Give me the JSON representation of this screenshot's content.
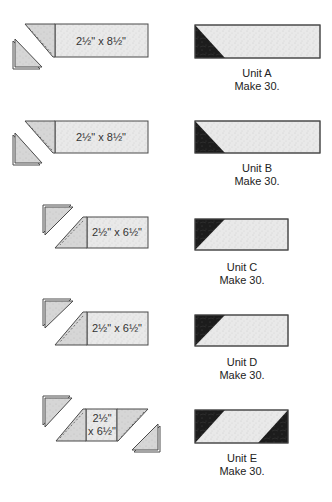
{
  "figure": {
    "rows": [
      {
        "id": "A",
        "cut_label": "2½\" x 8½\"",
        "unit_label": "Unit A",
        "make_label": "Make 30."
      },
      {
        "id": "B",
        "cut_label": "2½\" x 8½\"",
        "unit_label": "Unit B",
        "make_label": "Make 30."
      },
      {
        "id": "C",
        "cut_label": "2½\" x 6½\"",
        "unit_label": "Unit C",
        "make_label": "Make 30."
      },
      {
        "id": "D",
        "cut_label": "2½\" x 6½\"",
        "unit_label": "Unit D",
        "make_label": "Make 30."
      },
      {
        "id": "E",
        "cut_label_line1": "2½\"",
        "cut_label_line2": "x 6½\"",
        "unit_label": "Unit E",
        "make_label": "Make 30."
      }
    ]
  },
  "colors": {
    "background": "#ffffff",
    "light_fabric": "#e9e9e9",
    "corner_fabric": "#d6d6d6",
    "dark_fabric": "#1c1c1c",
    "outline": "#4a4a4a"
  }
}
